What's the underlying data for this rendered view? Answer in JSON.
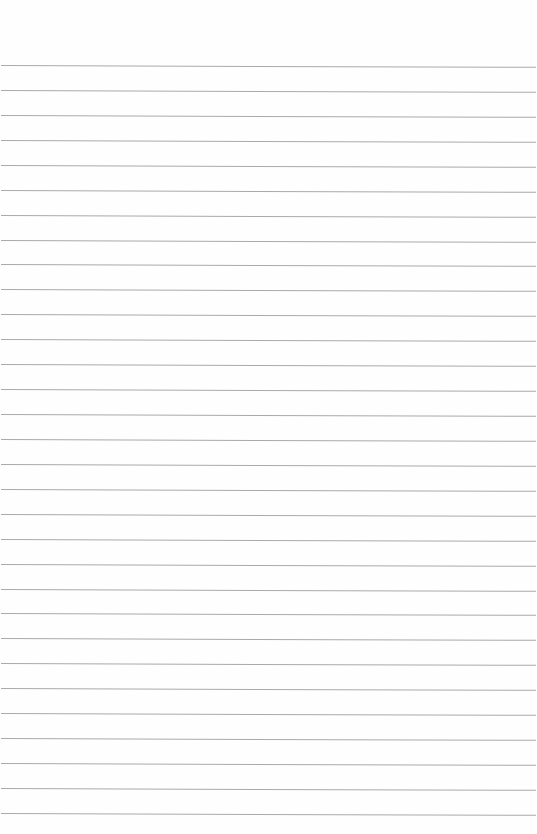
{
  "page": {
    "type": "ruled-paper",
    "background_color": "#ffffff",
    "line_color": "#a9a9a9",
    "line_count": 31,
    "first_line_y": 65,
    "line_spacing": 24.93,
    "text": ""
  }
}
